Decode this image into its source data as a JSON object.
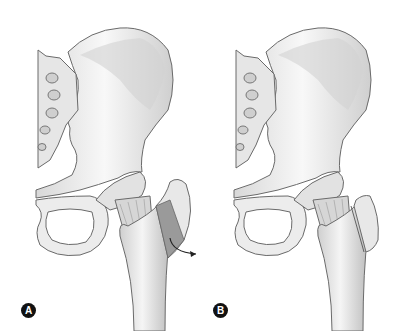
{
  "figure": {
    "panels": [
      {
        "label": "A",
        "description": "Pelvis and proximal femur with greater trochanter osteotomy segment highlighted and arrow indicating displacement"
      },
      {
        "label": "B",
        "description": "Pelvis and proximal femur with greater trochanter reattached; osteotomy line visible"
      }
    ],
    "colors": {
      "bone_fill": "#ececec",
      "bone_shade": "#c4c4c4",
      "outline": "#6a6a6a",
      "segment": "#9a9a9a",
      "badge": "#111111",
      "arrow": "#222222"
    }
  }
}
